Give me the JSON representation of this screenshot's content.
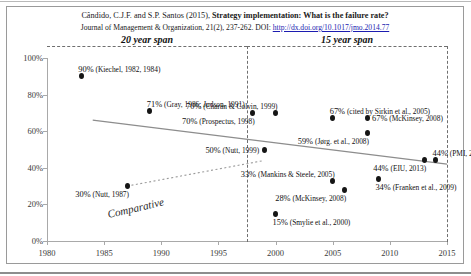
{
  "figure": {
    "citation_line1_prefix": "Cândido, C.J.F. and S.P. Santos (2015), ",
    "citation_line1_title": "Strategy implementation: What is the failure rate?",
    "citation_line2_prefix": "Journal of Management & Organization, 21(2), 237-262. DOI: ",
    "citation_line2_doi": "http://dx.doi.org/10.1017/jmo.2014.77"
  },
  "annotations": {
    "span_left": "20 year span",
    "span_right": "15 year span",
    "comparative": "Comparative"
  },
  "chart_data": {
    "type": "scatter",
    "title": "Strategy implementation: What is the failure rate?",
    "xlabel": "",
    "ylabel": "",
    "xlim": [
      1980,
      2015
    ],
    "ylim": [
      0,
      100
    ],
    "xticks": [
      "1980",
      "1985",
      "1990",
      "1995",
      "2000",
      "2005",
      "2010",
      "2015"
    ],
    "xtick_values": [
      1980,
      1985,
      1990,
      1995,
      2000,
      2005,
      2010,
      2015
    ],
    "yticks": [
      "0%",
      "20%",
      "40%",
      "60%",
      "80%",
      "100%"
    ],
    "ytick_values": [
      0,
      20,
      40,
      60,
      80,
      100
    ],
    "grid": false,
    "legend": "none",
    "points": [
      {
        "x": 1983,
        "y": 90,
        "value": "90%",
        "source": "(Kiechel, 1982, 1984)",
        "label_pos": "above-right"
      },
      {
        "x": 1989,
        "y": 71,
        "value": "71%",
        "source": "(Gray, 1986; Judson, 1991)",
        "label_pos": "above-right"
      },
      {
        "x": 1998,
        "y": 70,
        "value": "70%",
        "source": "(Prospectus, 1998)",
        "label_pos": "below-left"
      },
      {
        "x": 2000,
        "y": 70,
        "value": "70%",
        "source": "(Charan & Colvin, 1999)",
        "label_pos": "above-left"
      },
      {
        "x": 2005,
        "y": 67,
        "value": "67%",
        "source": "(cited by Sirkin et al., 2005)",
        "label_pos": "above-right"
      },
      {
        "x": 2008,
        "y": 67,
        "value": "67%",
        "source": "(McKinsey, 2008)",
        "label_pos": "right"
      },
      {
        "x": 2008,
        "y": 59,
        "value": "59%",
        "source": "(Jørg. et al., 2008)",
        "label_pos": "below-left"
      },
      {
        "x": 1999,
        "y": 50,
        "value": "50%",
        "source": "(Nutt, 1999)",
        "label_pos": "left"
      },
      {
        "x": 2014,
        "y": 44,
        "value": "44%",
        "source": "(PMI, 2014)",
        "label_pos": "above-right"
      },
      {
        "x": 2013,
        "y": 44,
        "value": "44%",
        "source": "(EIU, 2013)",
        "label_pos": "below-left"
      },
      {
        "x": 2009,
        "y": 34,
        "value": "34%",
        "source": "(Franken et al., 2009)",
        "label_pos": "below-right"
      },
      {
        "x": 2005,
        "y": 33,
        "value": "33%",
        "source": "(Mankins & Steele, 2005)",
        "label_pos": "above-left"
      },
      {
        "x": 2006,
        "y": 28,
        "value": "28%",
        "source": "(McKinsey, 2008)",
        "label_pos": "below-left"
      },
      {
        "x": 1987,
        "y": 30,
        "value": "30%",
        "source": "(Nutt, 1987)",
        "label_pos": "below-left"
      },
      {
        "x": 2000,
        "y": 15,
        "value": "15%",
        "source": "(Smylie et al., 2000)",
        "label_pos": "below-right"
      }
    ],
    "trend_main": {
      "x1": 1984,
      "y1": 66,
      "x2": 2015,
      "y2": 42,
      "style": "solid"
    },
    "trend_comparative": {
      "x1": 1987,
      "y1": 30,
      "x2": 1999,
      "y2": 44,
      "style": "dotted"
    },
    "divider_year": 2000,
    "spans": [
      {
        "label": "20 year span",
        "from": 1980,
        "to": 2000
      },
      {
        "label": "15 year span",
        "from": 2000,
        "to": 2015
      }
    ]
  }
}
